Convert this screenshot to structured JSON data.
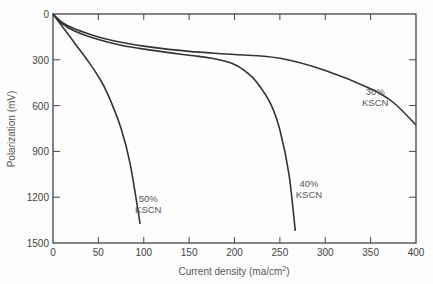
{
  "chart_data": {
    "type": "line",
    "title": "",
    "xlabel": "Current density (ma/cm²)",
    "xlabel_main": "Current density (ma/cm",
    "xlabel_sup": "2",
    "xlabel_end": ")",
    "ylabel": "Polarization (mV)",
    "xlim": [
      0,
      400
    ],
    "ylim": [
      0,
      1500
    ],
    "y_inverted": true,
    "grid": false,
    "x_ticks": [
      0,
      50,
      100,
      150,
      200,
      250,
      300,
      350,
      400
    ],
    "y_ticks": [
      0,
      300,
      600,
      900,
      1200,
      1500
    ],
    "series": [
      {
        "name": "30% KSCN",
        "label_lines": [
          "30%",
          "KSCN"
        ],
        "label_pos": [
          355,
          530
        ],
        "x": [
          0,
          10,
          25,
          50,
          75,
          100,
          150,
          200,
          250,
          300,
          350,
          375,
          400
        ],
        "y": [
          0,
          55,
          100,
          150,
          185,
          210,
          245,
          265,
          290,
          370,
          490,
          580,
          727
        ]
      },
      {
        "name": "40% KSCN",
        "label_lines": [
          "40%",
          "KSCN"
        ],
        "label_pos": [
          282,
          1130
        ],
        "x": [
          0,
          10,
          25,
          50,
          75,
          100,
          150,
          175,
          200,
          215,
          225,
          240,
          250,
          260,
          267
        ],
        "y": [
          0,
          62,
          115,
          168,
          205,
          230,
          270,
          290,
          330,
          390,
          450,
          590,
          760,
          1050,
          1420
        ]
      },
      {
        "name": "50% KSCN",
        "label_lines": [
          "50%",
          "KSCN"
        ],
        "label_pos": [
          105,
          1230
        ],
        "x": [
          0,
          10,
          25,
          40,
          50,
          60,
          75,
          85,
          96
        ],
        "y": [
          0,
          80,
          200,
          320,
          410,
          520,
          750,
          980,
          1375
        ]
      }
    ]
  }
}
